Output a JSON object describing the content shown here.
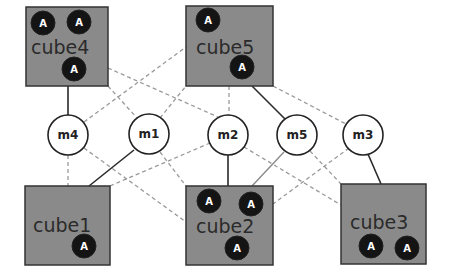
{
  "diagram": {
    "colors": {
      "cube_fill": "#8a8a8a",
      "cube_stroke": "#333333",
      "agent_fill": "#141414",
      "agent_text": "#ffffff",
      "node_fill": "#ffffff",
      "solid_edge": "#2a2a2a",
      "dashed_edge": "#9a9a9a"
    },
    "cubes": [
      {
        "id": "cube4",
        "label": "cube4",
        "agents": [
          "A",
          "A",
          "A"
        ]
      },
      {
        "id": "cube5",
        "label": "cube5",
        "agents": [
          "A",
          "A"
        ]
      },
      {
        "id": "cube1",
        "label": "cube1",
        "agents": [
          "A"
        ]
      },
      {
        "id": "cube2",
        "label": "cube2",
        "agents": [
          "A",
          "A",
          "A"
        ]
      },
      {
        "id": "cube3",
        "label": "cube3",
        "agents": [
          "A",
          "A"
        ]
      }
    ],
    "nodes": [
      {
        "id": "m4",
        "label": "m4"
      },
      {
        "id": "m1",
        "label": "m1"
      },
      {
        "id": "m2",
        "label": "m2"
      },
      {
        "id": "m5",
        "label": "m5"
      },
      {
        "id": "m3",
        "label": "m3"
      }
    ],
    "edges_solid": [
      [
        "cube4",
        "m4"
      ],
      [
        "m1",
        "cube1"
      ],
      [
        "cube5",
        "m5"
      ],
      [
        "m2",
        "cube2"
      ],
      [
        "m3",
        "cube3"
      ],
      [
        "m5",
        "cube2"
      ]
    ],
    "edges_dashed": [
      [
        "cube4",
        "m1"
      ],
      [
        "cube4",
        "m2"
      ],
      [
        "m4",
        "cube5"
      ],
      [
        "m1",
        "cube5"
      ],
      [
        "cube5",
        "m2"
      ],
      [
        "cube5",
        "m3"
      ],
      [
        "m4",
        "cube1"
      ],
      [
        "m4",
        "cube2"
      ],
      [
        "m1",
        "cube2"
      ],
      [
        "cube1",
        "m2"
      ],
      [
        "m2",
        "cube3"
      ],
      [
        "m5",
        "cube3"
      ],
      [
        "m3",
        "cube2"
      ]
    ]
  }
}
